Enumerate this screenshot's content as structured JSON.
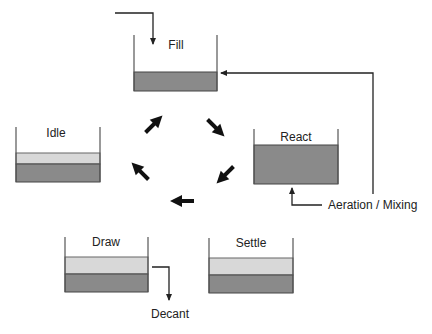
{
  "diagram": {
    "colors": {
      "sludge": "#8a8a8a",
      "clear_water": "#d8d8d8",
      "wall": "#555555",
      "line": "#222222",
      "arrow": "#111111"
    },
    "tanks": [
      {
        "id": "fill",
        "label": "Fill"
      },
      {
        "id": "react",
        "label": "React"
      },
      {
        "id": "settle",
        "label": "Settle"
      },
      {
        "id": "draw",
        "label": "Draw"
      },
      {
        "id": "idle",
        "label": "Idle"
      }
    ],
    "annotations": {
      "aeration": "Aeration / Mixing",
      "decant": "Decant"
    },
    "cycle_order": [
      "Fill",
      "React",
      "Settle",
      "Draw",
      "Idle"
    ]
  }
}
